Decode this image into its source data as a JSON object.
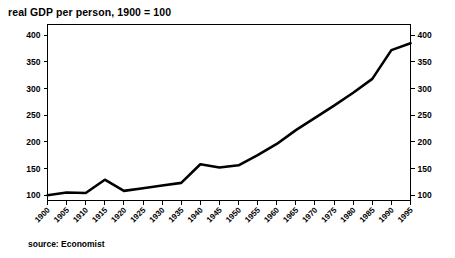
{
  "chart_data": {
    "type": "line",
    "title": "real GDP per person, 1900 = 100",
    "subtitle": "",
    "xlabel": "",
    "ylabel": "",
    "source": "source: Economist",
    "xlim": [
      1900,
      1995
    ],
    "ylim": [
      90,
      420
    ],
    "y_ticks": [
      100,
      150,
      200,
      250,
      300,
      350,
      400
    ],
    "y_axis_right_ticks": [
      100,
      150,
      200,
      250,
      300,
      350,
      400
    ],
    "grid": false,
    "legend": "none",
    "line_color": "#000000",
    "x": [
      1900,
      1905,
      1910,
      1915,
      1920,
      1925,
      1930,
      1935,
      1940,
      1945,
      1950,
      1955,
      1960,
      1965,
      1970,
      1975,
      1980,
      1985,
      1990,
      1995
    ],
    "categories": [
      "1900",
      "1905",
      "1910",
      "1915",
      "1920",
      "1925",
      "1930",
      "1935",
      "1940",
      "1945",
      "1950",
      "1955",
      "1960",
      "1965",
      "1970",
      "1975",
      "1980",
      "1985",
      "1990",
      "1995"
    ],
    "values": [
      100,
      105,
      104,
      129,
      108,
      113,
      118,
      123,
      158,
      152,
      156,
      175,
      196,
      222,
      245,
      268,
      292,
      318,
      372,
      385
    ],
    "series": [
      {
        "name": "real GDP per person",
        "values": [
          100,
          105,
          104,
          129,
          108,
          113,
          118,
          123,
          158,
          152,
          156,
          175,
          196,
          222,
          245,
          268,
          292,
          318,
          372,
          385
        ]
      }
    ]
  }
}
